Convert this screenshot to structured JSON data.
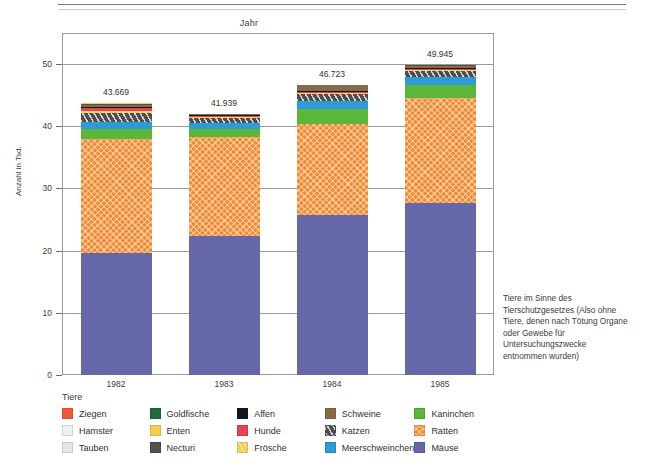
{
  "figure": {
    "axis_title_top": "Jahr",
    "y_axis_title": "Anzahl in Tsd.",
    "legend_title": "Tiere",
    "side_note": "Tiere im Sinne des Tierschutzgesetzes (Also ohne Tiere, denen nach Tötung Organe oder Gewebe für Untersuchungszwecke entnommen wurden)"
  },
  "chart_data": {
    "type": "bar",
    "stacked": true,
    "title": "",
    "xlabel": "Jahr",
    "ylabel": "Anzahl in Tsd.",
    "ylim": [
      0,
      54
    ],
    "yticks": [
      0,
      10,
      20,
      30,
      40,
      50
    ],
    "ytick_labels": [
      "0",
      "10",
      "20",
      "30",
      "40",
      "50"
    ],
    "grid": true,
    "legend_position": "bottom",
    "categories": [
      "1982",
      "1983",
      "1984",
      "1985"
    ],
    "totals_labels": [
      "43.669",
      "41.939",
      "46.723",
      "49.945"
    ],
    "totals": [
      43.669,
      41.939,
      46.723,
      49.945
    ],
    "series": [
      {
        "name": "Mäuse",
        "color": "#6567a8",
        "values": [
          19.6,
          22.3,
          25.7,
          27.7
        ]
      },
      {
        "name": "Ratten",
        "color": "#f1892d",
        "values": [
          18.4,
          15.9,
          14.7,
          16.9
        ]
      },
      {
        "name": "Kaninchen",
        "color": "#5bb73a",
        "values": [
          1.5,
          1.4,
          2.4,
          2.0
        ]
      },
      {
        "name": "Meerschweinchen",
        "color": "#2e9bd8",
        "values": [
          1.2,
          0.9,
          1.3,
          1.3
        ]
      },
      {
        "name": "Katzen",
        "color": "#4e4e4e",
        "values": [
          1.5,
          0.8,
          1.1,
          0.9
        ]
      },
      {
        "name": "Frösche",
        "color": "#f5cf53",
        "values": [
          0.3,
          0.2,
          0.2,
          0.2
        ]
      },
      {
        "name": "Hunde",
        "color": "#e8444f",
        "values": [
          0.4,
          0.2,
          0.2,
          0.2
        ]
      },
      {
        "name": "Affen",
        "color": "#15161f",
        "values": [
          0.2,
          0.1,
          0.1,
          0.1
        ]
      },
      {
        "name": "Schweine",
        "color": "#8a6a46",
        "values": [
          0.4,
          0.1,
          0.9,
          0.5
        ]
      },
      {
        "name": "Necturi",
        "color": "#4d5448",
        "values": [
          0.1,
          0.0,
          0.0,
          0.1
        ]
      },
      {
        "name": "Enten",
        "color": "#f4ce51",
        "values": [
          0.1,
          0.0,
          0.0,
          0.0
        ]
      },
      {
        "name": "Goldfische",
        "color": "#1f6b3d",
        "values": [
          0.0,
          0.0,
          0.0,
          0.0
        ]
      },
      {
        "name": "Ziegen",
        "color": "#ee5b3b",
        "values": [
          0.0,
          0.0,
          0.0,
          0.0
        ]
      },
      {
        "name": "Hamster",
        "color": "#eef0f4",
        "values": [
          0.0,
          0.0,
          0.0,
          0.0
        ]
      },
      {
        "name": "Tauben",
        "color": "#e6e6e6",
        "values": [
          0.0,
          0.0,
          0.0,
          0.0
        ]
      }
    ]
  },
  "legend": {
    "title": "Tiere",
    "columns": [
      [
        {
          "label": "Ziegen",
          "color": "#ee5b3b",
          "fill": "fill-ziegen"
        },
        {
          "label": "Hamster",
          "color": "#eef0f4",
          "fill": "fill-hamster"
        },
        {
          "label": "Tauben",
          "color": "#e6e6e6",
          "fill": "fill-tauben"
        }
      ],
      [
        {
          "label": "Goldfische",
          "color": "#1f6b3d",
          "fill": "fill-goldfische"
        },
        {
          "label": "Enten",
          "color": "#f4ce51",
          "fill": "fill-enten"
        },
        {
          "label": "Necturi",
          "color": "#4d5448",
          "fill": "fill-necturi"
        }
      ],
      [
        {
          "label": "Affen",
          "color": "#15161f",
          "fill": "fill-affen"
        },
        {
          "label": "Hunde",
          "color": "#e8444f",
          "fill": "fill-hunde"
        },
        {
          "label": "Frösche",
          "color": "#f5cf53",
          "fill": "fill-froesche"
        }
      ],
      [
        {
          "label": "Schweine",
          "color": "#8a6a46",
          "fill": "fill-schweine"
        },
        {
          "label": "Katzen",
          "color": "#4e4e4e",
          "fill": "fill-katzen"
        },
        {
          "label": "Meerschweinchen",
          "color": "#2e9bd8",
          "fill": "fill-meerschweinchen"
        }
      ],
      [
        {
          "label": "Kaninchen",
          "color": "#5bb73a",
          "fill": "fill-kaninchen"
        },
        {
          "label": "Ratten",
          "color": "#f1892d",
          "fill": "fill-ratten"
        },
        {
          "label": "Mäuse",
          "color": "#6567a8",
          "fill": "fill-maeuse"
        }
      ]
    ]
  }
}
